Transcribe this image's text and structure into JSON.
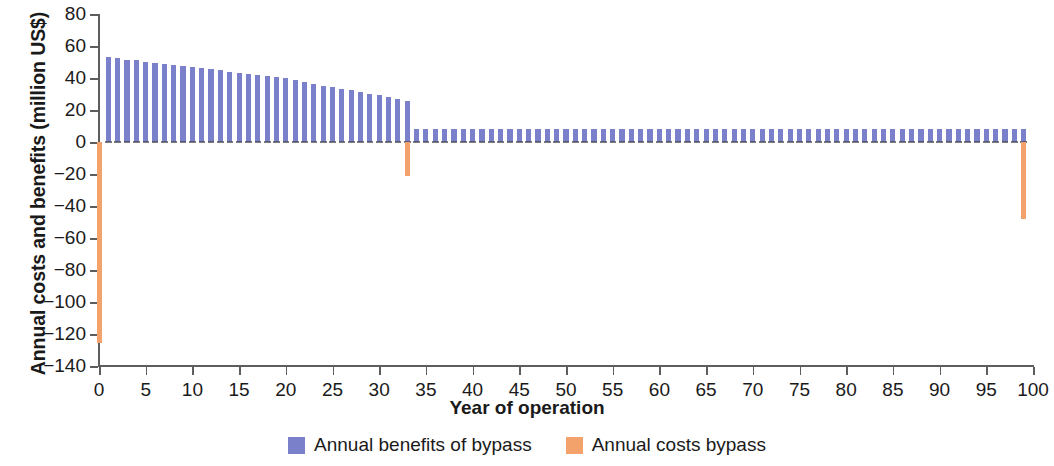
{
  "chart_data": {
    "type": "bar",
    "title": "",
    "xlabel": "Year of operation",
    "ylabel": "Annual costs and benefits (million US$)",
    "xlim": [
      0,
      100
    ],
    "ylim": [
      -140,
      80
    ],
    "xticks": [
      0,
      5,
      10,
      15,
      20,
      25,
      30,
      35,
      40,
      45,
      50,
      55,
      60,
      65,
      70,
      75,
      80,
      85,
      90,
      95,
      100
    ],
    "yticks": [
      80,
      60,
      40,
      20,
      0,
      -20,
      -40,
      -60,
      -80,
      -100,
      -120,
      -140
    ],
    "grid": false,
    "legend_position": "bottom",
    "colors": {
      "benefits": "#7b80cb",
      "costs": "#f4a26b",
      "axis": "#5d5d5d",
      "background": "#ffffff"
    },
    "legend": [
      {
        "label": "Annual benefits of bypass",
        "color": "#7b80cb"
      },
      {
        "label": "Annual costs bypass",
        "color": "#f4a26b"
      }
    ],
    "series": [
      {
        "name": "Annual benefits of bypass",
        "color": "#7b80cb",
        "x": [
          1,
          2,
          3,
          4,
          5,
          6,
          7,
          8,
          9,
          10,
          11,
          12,
          13,
          14,
          15,
          16,
          17,
          18,
          19,
          20,
          21,
          22,
          23,
          24,
          25,
          26,
          27,
          28,
          29,
          30,
          31,
          32,
          33,
          34,
          35,
          36,
          37,
          38,
          39,
          40,
          41,
          42,
          43,
          44,
          45,
          46,
          47,
          48,
          49,
          50,
          51,
          52,
          53,
          54,
          55,
          56,
          57,
          58,
          59,
          60,
          61,
          62,
          63,
          64,
          65,
          66,
          67,
          68,
          69,
          70,
          71,
          72,
          73,
          74,
          75,
          76,
          77,
          78,
          79,
          80,
          81,
          82,
          83,
          84,
          85,
          86,
          87,
          88,
          89,
          90,
          91,
          92,
          93,
          94,
          95,
          96,
          97,
          98,
          99
        ],
        "values": [
          53.0,
          52.2,
          51.4,
          51.0,
          50.3,
          49.6,
          48.9,
          48.2,
          47.5,
          46.8,
          46.1,
          45.4,
          44.7,
          44.0,
          43.3,
          42.6,
          41.9,
          41.2,
          40.5,
          39.8,
          38.5,
          37.3,
          36.2,
          35.2,
          34.3,
          33.4,
          32.5,
          31.4,
          30.3,
          29.3,
          28.0,
          26.8,
          25.5,
          8.2,
          8.2,
          8.2,
          8.2,
          8.2,
          8.2,
          8.2,
          8.2,
          8.2,
          8.2,
          8.2,
          8.2,
          8.2,
          8.2,
          8.2,
          8.2,
          8.2,
          8.2,
          8.2,
          8.2,
          8.2,
          8.2,
          8.2,
          8.2,
          8.2,
          8.2,
          8.2,
          8.2,
          8.2,
          8.2,
          8.2,
          8.2,
          8.2,
          8.2,
          8.2,
          8.2,
          8.2,
          8.2,
          8.2,
          8.2,
          8.2,
          8.2,
          8.2,
          8.2,
          8.2,
          8.2,
          8.2,
          8.2,
          8.2,
          8.2,
          8.2,
          8.2,
          8.2,
          8.2,
          8.2,
          8.2,
          8.2,
          8.2,
          8.2,
          8.2,
          8.2,
          8.2,
          8.2,
          8.2,
          8.2,
          8.2
        ]
      },
      {
        "name": "Annual costs bypass",
        "color": "#f4a26b",
        "x": [
          0,
          33,
          99
        ],
        "values": [
          -125.5,
          -21.0,
          -48.0
        ]
      }
    ]
  }
}
